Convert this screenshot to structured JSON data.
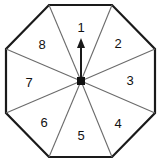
{
  "figure": {
    "name": "octagonal-spinner",
    "shape": "octagon",
    "sector_count": 8,
    "background_color": "#ffffff",
    "outline_color": "#1a1a1a",
    "divider_color": "#6b6b6b",
    "label_color": "#111111",
    "pointer": {
      "name": "spinner-arrow",
      "direction": "up",
      "points_to_sector": "1",
      "color": "#1a1a1a"
    },
    "hub": {
      "name": "center-pivot",
      "color": "#111111"
    },
    "sectors": [
      {
        "label": "1",
        "position": "top",
        "x": 81,
        "y": 28
      },
      {
        "label": "2",
        "position": "top-right",
        "x": 118,
        "y": 45
      },
      {
        "label": "3",
        "position": "right",
        "x": 130,
        "y": 82
      },
      {
        "label": "4",
        "position": "bottom-right",
        "x": 118,
        "y": 125
      },
      {
        "label": "5",
        "position": "bottom",
        "x": 81,
        "y": 137
      },
      {
        "label": "6",
        "position": "bottom-left",
        "x": 44,
        "y": 124
      },
      {
        "label": "7",
        "position": "left",
        "x": 29,
        "y": 84
      },
      {
        "label": "8",
        "position": "top-left",
        "x": 42,
        "y": 46
      }
    ],
    "octagon_vertices": [
      {
        "x": 49,
        "y": 5
      },
      {
        "x": 112,
        "y": 5
      },
      {
        "x": 155,
        "y": 49
      },
      {
        "x": 155,
        "y": 113
      },
      {
        "x": 112,
        "y": 157
      },
      {
        "x": 49,
        "y": 157
      },
      {
        "x": 6,
        "y": 113
      },
      {
        "x": 6,
        "y": 49
      }
    ]
  }
}
